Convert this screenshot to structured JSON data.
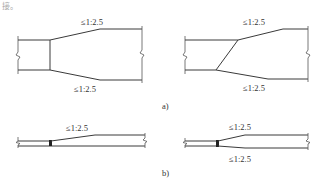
{
  "header_fragment": "接。",
  "figures": {
    "a": {
      "label": "a)",
      "left": {
        "slope_top": "≤1:2.5",
        "slope_bottom": "≤1:2.5"
      },
      "right": {
        "slope_top": "≤1:2.5",
        "slope_bottom": "≤1:2.5"
      }
    },
    "b": {
      "label": "b)",
      "left": {
        "slope_top": "≤1:2.5"
      },
      "right": {
        "slope_top": "≤1:2.5",
        "slope_bottom": "≤1:2.5"
      }
    }
  },
  "colors": {
    "line": "#3a3a3a",
    "text": "#333333",
    "background": "#ffffff"
  }
}
